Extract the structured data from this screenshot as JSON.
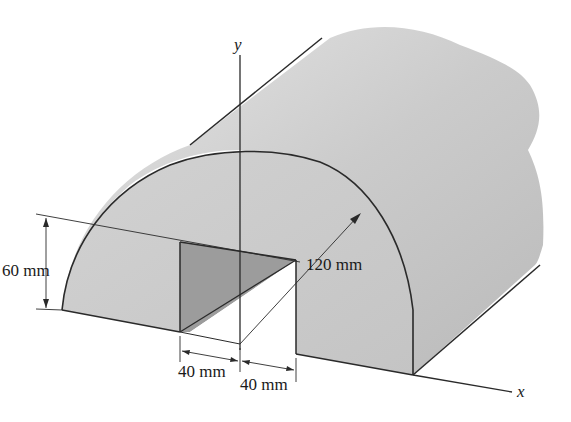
{
  "figure": {
    "dimensions": {
      "height_label": "60 mm",
      "radius_label": "120 mm",
      "left_width_label": "40 mm",
      "right_width_label": "40 mm"
    },
    "axes": {
      "y_label": "y",
      "x_label": "x"
    },
    "colors": {
      "body_light": "#cfcfcf",
      "body_mid": "#bdbdbd",
      "cut_shade": "#9c9c9c",
      "outline": "#2a2a2a",
      "background": "#ffffff"
    }
  }
}
